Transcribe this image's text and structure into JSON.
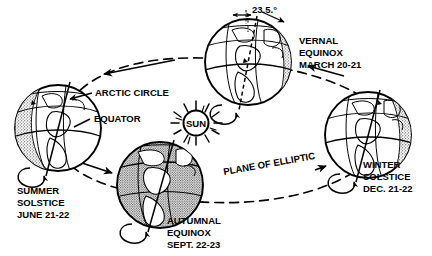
{
  "diagram": {
    "sun": {
      "label": "SUN"
    },
    "tilt": {
      "label": "23.5.°",
      "value": "23.5",
      "unit": "degrees"
    },
    "callouts": {
      "arctic_circle": "ARCTIC  CIRCLE",
      "equator": "EQUATOR",
      "plane": "PLANE  OF  ELLIPTIC"
    },
    "positions": [
      {
        "id": "summer-solstice",
        "name": "SUMMER",
        "line2": "SOLSTICE",
        "line3": "JUNE  21-22",
        "shading": "left-night"
      },
      {
        "id": "autumnal-equinox",
        "name": "AUTUMNAL",
        "line2": "EQUINOX",
        "line3": "SEPT. 22-23",
        "shading": "full-stipple"
      },
      {
        "id": "vernal-equinox",
        "name": "VERNAL",
        "line2": "EQUINOX",
        "line3": "MARCH 20-21",
        "shading": "right-night"
      },
      {
        "id": "winter-solstice",
        "name": "WINTER",
        "line2": "SOLSTICE",
        "line3": "DEC.  21-22",
        "shading": "right-night"
      }
    ],
    "colors": {
      "ink": "#000000",
      "paper": "#ffffff"
    }
  }
}
